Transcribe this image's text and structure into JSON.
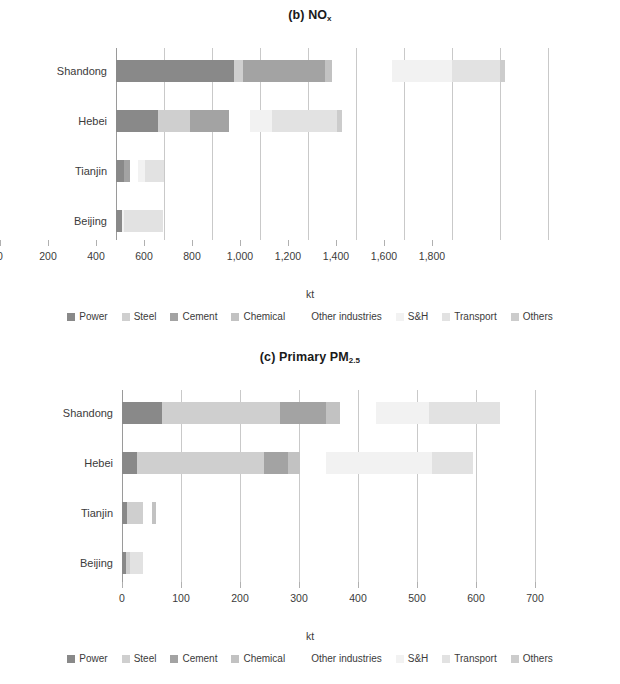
{
  "figure": {
    "axis_title": "kt",
    "categories": [
      "Shandong",
      "Hebei",
      "Tianjin",
      "Beijing"
    ],
    "sectors": [
      {
        "key": "power",
        "label": "Power",
        "color": "#898989"
      },
      {
        "key": "steel",
        "label": "Steel",
        "color": "#cfcfcf"
      },
      {
        "key": "cement",
        "label": "Cement",
        "color": "#a3a3a3"
      },
      {
        "key": "chemical",
        "label": "Chemical",
        "color": "#c2c2c2"
      },
      {
        "key": "other_industries",
        "label": "Other industries",
        "color": "#ffffff"
      },
      {
        "key": "sh",
        "label": "S&H",
        "color": "#f2f2f2"
      },
      {
        "key": "transport",
        "label": "Transport",
        "color": "#e2e2e2"
      },
      {
        "key": "others",
        "label": "Others",
        "color": "#cccccc"
      }
    ]
  },
  "chart_data": [
    {
      "id": "nox",
      "type": "bar",
      "orientation": "horizontal",
      "stacked": true,
      "title": "(b) NO",
      "title_sub": "x",
      "xlabel": "kt",
      "ylabel": "",
      "xlim": [
        0,
        1800
      ],
      "xticks": [
        0,
        200,
        400,
        600,
        800,
        1000,
        1200,
        1400,
        1600,
        1800
      ],
      "xticklabels": [
        "0",
        "200",
        "400",
        "600",
        "800",
        "1,000",
        "1,200",
        "1,400",
        "1,600",
        "1,800"
      ],
      "grid": "vertical",
      "legend_position": "bottom",
      "categories": [
        "Shandong",
        "Hebei",
        "Tianjin",
        "Beijing"
      ],
      "series": [
        {
          "name": "Power",
          "values": [
            490,
            175,
            35,
            25
          ]
        },
        {
          "name": "Steel",
          "values": [
            40,
            135,
            0,
            0
          ]
        },
        {
          "name": "Cement",
          "values": [
            340,
            160,
            25,
            0
          ]
        },
        {
          "name": "Chemical",
          "values": [
            30,
            0,
            0,
            0
          ]
        },
        {
          "name": "Other industries",
          "values": [
            0,
            0,
            0,
            0
          ]
        },
        {
          "name": "S&H",
          "values": [
            250,
            90,
            30,
            10
          ]
        },
        {
          "name": "Transport",
          "values": [
            450,
            340,
            110,
            160
          ]
        },
        {
          "name": "Others",
          "values": [
            20,
            20,
            0,
            0
          ]
        }
      ],
      "totals": [
        1620,
        920,
        200,
        195
      ]
    },
    {
      "id": "pm25",
      "type": "bar",
      "orientation": "horizontal",
      "stacked": true,
      "title": "(c) Primary PM",
      "title_sub": "2.5",
      "xlabel": "kt",
      "ylabel": "",
      "xlim": [
        0,
        700
      ],
      "xticks": [
        0,
        100,
        200,
        300,
        400,
        500,
        600,
        700
      ],
      "xticklabels": [
        "0",
        "100",
        "200",
        "300",
        "400",
        "500",
        "600",
        "700"
      ],
      "grid": "vertical",
      "legend_position": "bottom",
      "categories": [
        "Shandong",
        "Hebei",
        "Tianjin",
        "Beijing"
      ],
      "series": [
        {
          "name": "Power",
          "values": [
            68,
            25,
            8,
            7
          ]
        },
        {
          "name": "Steel",
          "values": [
            200,
            215,
            28,
            7
          ]
        },
        {
          "name": "Cement",
          "values": [
            77,
            42,
            0,
            0
          ]
        },
        {
          "name": "Chemical",
          "values": [
            25,
            20,
            7,
            0
          ]
        },
        {
          "name": "Other industries",
          "values": [
            0,
            0,
            0,
            0
          ]
        },
        {
          "name": "S&H",
          "values": [
            90,
            180,
            0,
            0
          ]
        },
        {
          "name": "Transport",
          "values": [
            120,
            70,
            0,
            22
          ]
        },
        {
          "name": "Others",
          "values": [
            0,
            0,
            0,
            0
          ]
        }
      ],
      "totals": [
        640,
        595,
        57,
        36
      ]
    }
  ],
  "nox_segments": {
    "Shandong": [
      {
        "sector": "power",
        "start": 0,
        "end": 490
      },
      {
        "sector": "steel",
        "start": 490,
        "end": 530
      },
      {
        "sector": "cement",
        "start": 530,
        "end": 870
      },
      {
        "sector": "chemical",
        "start": 870,
        "end": 900
      },
      {
        "sector": "sh",
        "start": 1150,
        "end": 1400
      },
      {
        "sector": "transport",
        "start": 1400,
        "end": 1600
      },
      {
        "sector": "others",
        "start": 1600,
        "end": 1620
      }
    ],
    "Hebei": [
      {
        "sector": "power",
        "start": 0,
        "end": 175
      },
      {
        "sector": "steel",
        "start": 175,
        "end": 310
      },
      {
        "sector": "cement",
        "start": 310,
        "end": 470
      },
      {
        "sector": "sh",
        "start": 560,
        "end": 650
      },
      {
        "sector": "transport",
        "start": 650,
        "end": 920
      },
      {
        "sector": "others",
        "start": 920,
        "end": 940
      }
    ],
    "Tianjin": [
      {
        "sector": "power",
        "start": 0,
        "end": 35
      },
      {
        "sector": "cement",
        "start": 35,
        "end": 60
      },
      {
        "sector": "sh",
        "start": 90,
        "end": 120
      },
      {
        "sector": "transport",
        "start": 120,
        "end": 200
      }
    ],
    "Beijing": [
      {
        "sector": "power",
        "start": 0,
        "end": 25
      },
      {
        "sector": "sh",
        "start": 25,
        "end": 35
      },
      {
        "sector": "transport",
        "start": 35,
        "end": 195
      }
    ]
  },
  "pm25_segments": {
    "Shandong": [
      {
        "sector": "power",
        "start": 0,
        "end": 68
      },
      {
        "sector": "steel",
        "start": 68,
        "end": 268
      },
      {
        "sector": "cement",
        "start": 268,
        "end": 345
      },
      {
        "sector": "chemical",
        "start": 345,
        "end": 370
      },
      {
        "sector": "sh",
        "start": 430,
        "end": 520
      },
      {
        "sector": "transport",
        "start": 520,
        "end": 640
      }
    ],
    "Hebei": [
      {
        "sector": "power",
        "start": 0,
        "end": 25
      },
      {
        "sector": "steel",
        "start": 25,
        "end": 240
      },
      {
        "sector": "cement",
        "start": 240,
        "end": 282
      },
      {
        "sector": "chemical",
        "start": 282,
        "end": 302
      },
      {
        "sector": "sh",
        "start": 345,
        "end": 525
      },
      {
        "sector": "transport",
        "start": 525,
        "end": 595
      }
    ],
    "Tianjin": [
      {
        "sector": "power",
        "start": 0,
        "end": 8
      },
      {
        "sector": "steel",
        "start": 8,
        "end": 36
      },
      {
        "sector": "chemical",
        "start": 50,
        "end": 57
      }
    ],
    "Beijing": [
      {
        "sector": "power",
        "start": 0,
        "end": 7
      },
      {
        "sector": "steel",
        "start": 7,
        "end": 14
      },
      {
        "sector": "transport",
        "start": 14,
        "end": 36
      }
    ]
  }
}
